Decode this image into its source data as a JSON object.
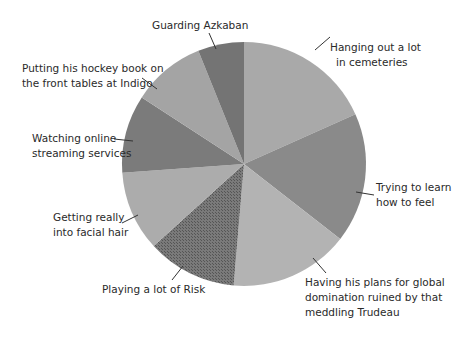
{
  "chart_data": {
    "type": "pie",
    "title": "",
    "start_angle_deg": 0,
    "direction": "clockwise",
    "slices": [
      {
        "label": "Hanging out a lot in cemeteries",
        "value": 18.3,
        "color": "#a9a9a9"
      },
      {
        "label": "Trying to learn how to feel",
        "value": 17.2,
        "color": "#8a8a8a"
      },
      {
        "label": "Having his plans for global domination ruined by that meddling Trudeau",
        "value": 15.8,
        "color": "#b3b3b3"
      },
      {
        "label": "Playing a lot of Risk",
        "value": 11.9,
        "color": "#6f6f6f"
      },
      {
        "label": "Getting really into facial hair",
        "value": 10.6,
        "color": "#acacac"
      },
      {
        "label": "Watching online streaming services",
        "value": 10.3,
        "color": "#7b7b7b"
      },
      {
        "label": "Putting his hockey book on the front tables at Indigo",
        "value": 9.7,
        "color": "#a4a4a4"
      },
      {
        "label": "Guarding Azkaban",
        "value": 6.1,
        "color": "#747474"
      }
    ],
    "legend": "callout labels with leader lines"
  },
  "labels": {
    "hanging": [
      "Hanging out a lot",
      "in cemeteries"
    ],
    "trying": [
      "Trying to learn",
      "how to feel"
    ],
    "having": [
      "Having his plans for global",
      "domination ruined by that",
      "meddling Trudeau"
    ],
    "risk": [
      "Playing a lot of Risk"
    ],
    "facial": [
      "Getting really",
      "into facial hair"
    ],
    "watching": [
      "Watching online",
      "streaming services"
    ],
    "putting": [
      "Putting his hockey book on",
      "the front tables at Indigo"
    ],
    "guarding": [
      "Guarding Azkaban"
    ]
  }
}
